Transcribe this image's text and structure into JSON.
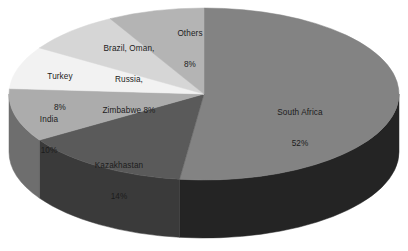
{
  "chart_data": {
    "type": "pie",
    "title": "",
    "subtitle": "",
    "xlabel": "",
    "ylabel": "",
    "legend": "none",
    "grid": false,
    "three_d": true,
    "units": "percent",
    "labels_inside": true,
    "categories": [
      "South Africa",
      "Kazakhastan",
      "India",
      "Turkey",
      "Brazil, Oman, Russia, Zimbabwe",
      "Others"
    ],
    "values": [
      52,
      14,
      10,
      8,
      8,
      8
    ],
    "value_labels": [
      "52%",
      "14%",
      "10%",
      "8%",
      "8%",
      "8%"
    ],
    "colors": [
      "#838383",
      "#5a5a5a",
      "#acacac",
      "#f2f2f2",
      "#d6d6d6",
      "#b4b4b4"
    ],
    "side_colors": [
      "#242424",
      "#3a3a3a",
      "#6e6e6e",
      "#a8a8a8",
      "#949494",
      "#7d7d7d"
    ],
    "slices": [
      {
        "name": "South Africa",
        "value": 52,
        "value_label": "52%",
        "label_line1": "South Africa",
        "label_line2": "52%",
        "color": "#838383",
        "side_color": "#242424"
      },
      {
        "name": "Kazakhastan",
        "value": 14,
        "value_label": "14%",
        "label_line1": "Kazakhastan",
        "label_line2": "14%",
        "color": "#5a5a5a",
        "side_color": "#3a3a3a"
      },
      {
        "name": "India",
        "value": 10,
        "value_label": "10%",
        "label_line1": "India",
        "label_line2": "10%",
        "color": "#acacac",
        "side_color": "#6e6e6e"
      },
      {
        "name": "Turkey",
        "value": 8,
        "value_label": "8%",
        "label_line1": "Turkey",
        "label_line2": "8%",
        "color": "#f2f2f2",
        "side_color": "#a8a8a8"
      },
      {
        "name": "Brazil, Oman, Russia, Zimbabwe",
        "value": 8,
        "value_label": "8%",
        "label_line1": "Brazil, Oman,",
        "label_line2": "Russia,",
        "label_line3": "Zimbabwe 8%",
        "color": "#d6d6d6",
        "side_color": "#949494"
      },
      {
        "name": "Others",
        "value": 8,
        "value_label": "8%",
        "label_line1": "Others",
        "label_line2": "8%",
        "color": "#b4b4b4",
        "side_color": "#7d7d7d"
      }
    ]
  },
  "canvas": {
    "background": "#ffffff",
    "text_color": "#1c1c1c"
  }
}
